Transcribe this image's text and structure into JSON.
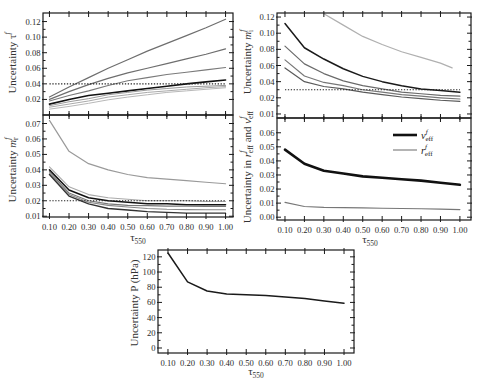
{
  "chart_data": [
    {
      "panel": "top-left",
      "type": "line",
      "title": "",
      "xlabel": "",
      "xlabel_parts": [],
      "ylabel": "Uncertainty τ^f",
      "ylabel_parts": [
        {
          "t": "Uncertainty τ"
        },
        {
          "sup": "f"
        }
      ],
      "xlim": [
        0.067,
        1.038
      ],
      "ylim": [
        0,
        0.131
      ],
      "grid": false,
      "x": [
        0.1,
        0.2,
        0.3,
        0.4,
        0.5,
        0.6,
        0.7,
        0.8,
        0.9,
        1.0
      ],
      "xticks": [
        0.1,
        0.2,
        0.3,
        0.4,
        0.5,
        0.6,
        0.7,
        0.8,
        0.9,
        1.0
      ],
      "xtick_labels": [],
      "yticks": [
        0.02,
        0.04,
        0.06,
        0.08,
        0.1,
        0.12
      ],
      "ytick_labels": [
        "0.02",
        "0.04",
        "0.06",
        "0.08",
        "0.10",
        "0.12"
      ],
      "series": [
        {
          "values": [
            0.023,
            0.036,
            0.048,
            0.06,
            0.071,
            0.082,
            0.092,
            0.102,
            0.112,
            0.123
          ],
          "color": "#6e6e6e",
          "width": 1.2,
          "style": "solid"
        },
        {
          "values": [
            0.02,
            0.03,
            0.039,
            0.047,
            0.054,
            0.06,
            0.066,
            0.072,
            0.078,
            0.085
          ],
          "color": "#6e6e6e",
          "width": 1.2,
          "style": "solid"
        },
        {
          "values": [
            0.018,
            0.025,
            0.031,
            0.038,
            0.044,
            0.048,
            0.052,
            0.055,
            0.058,
            0.061
          ],
          "color": "#7a7a7a",
          "width": 1.1,
          "style": "solid"
        },
        {
          "values": [
            0.014,
            0.02,
            0.025,
            0.028,
            0.031,
            0.034,
            0.037,
            0.04,
            0.0425,
            0.045
          ],
          "color": "#111111",
          "width": 1.6,
          "style": "solid"
        },
        {
          "values": [
            0.012,
            0.017,
            0.021,
            0.026,
            0.029,
            0.032,
            0.034,
            0.036,
            0.037,
            0.038
          ],
          "color": "#9a9a9a",
          "width": 1.0,
          "style": "solid"
        },
        {
          "values": [
            0.01,
            0.014,
            0.018,
            0.023,
            0.026,
            0.029,
            0.031,
            0.033,
            0.035,
            0.0365
          ],
          "color": "#aaaaaa",
          "width": 1.0,
          "style": "solid"
        },
        {
          "values": [
            0.0075,
            0.011,
            0.015,
            0.0195,
            0.023,
            0.026,
            0.029,
            0.031,
            0.033,
            0.035
          ],
          "color": "#b8b8b8",
          "width": 1.0,
          "style": "solid"
        },
        {
          "values": [
            0.04,
            0.04,
            0.04,
            0.04,
            0.04,
            0.04,
            0.04,
            0.04,
            0.04,
            0.04
          ],
          "color": "#222222",
          "width": 1.2,
          "style": "dotted"
        }
      ],
      "legend": null
    },
    {
      "panel": "top-right",
      "type": "line",
      "title": "",
      "xlabel": "",
      "xlabel_parts": [],
      "ylabel": "Uncertainty m_i^f",
      "ylabel_parts": [
        {
          "t": "Uncertainty "
        },
        {
          "t": "m",
          "i": true
        },
        {
          "sub": "i",
          "sup": "f"
        }
      ],
      "xlim": [
        0.059,
        1.057
      ],
      "ylim": [
        -0.005,
        0.125
      ],
      "grid": false,
      "x": [
        0.1,
        0.2,
        0.3,
        0.4,
        0.5,
        0.6,
        0.7,
        0.8,
        0.9,
        1.0
      ],
      "xticks": [
        0.1,
        0.2,
        0.3,
        0.4,
        0.5,
        0.6,
        0.7,
        0.8,
        0.9,
        1.0
      ],
      "xtick_labels": [],
      "yticks": [
        0.0,
        0.02,
        0.04,
        0.06,
        0.08,
        0.1,
        0.12
      ],
      "ytick_labels": [
        "0.01",
        "0.02",
        "0.04",
        "0.06",
        "0.08",
        "0.10",
        "0.12"
      ],
      "series": [
        {
          "x": [
            0.3,
            0.4,
            0.5,
            0.6,
            0.7,
            0.8,
            0.9,
            0.96
          ],
          "values": [
            0.124,
            0.11,
            0.096,
            0.086,
            0.077,
            0.07,
            0.063,
            0.057
          ],
          "color": "#b0b0b0",
          "width": 1.2,
          "style": "solid"
        },
        {
          "values": [
            0.112,
            0.082,
            0.068,
            0.056,
            0.0465,
            0.04,
            0.035,
            0.031,
            0.029,
            0.027
          ],
          "color": "#1a1a1a",
          "width": 1.5,
          "style": "solid"
        },
        {
          "values": [
            0.084,
            0.062,
            0.05,
            0.041,
            0.035,
            0.031,
            0.027,
            0.025,
            0.023,
            0.022
          ],
          "color": "#6a6a6a",
          "width": 1.2,
          "style": "solid"
        },
        {
          "values": [
            0.067,
            0.047,
            0.039,
            0.035,
            0.03,
            0.027,
            0.024,
            0.022,
            0.02,
            0.0185
          ],
          "color": "#777777",
          "width": 1.2,
          "style": "solid"
        },
        {
          "values": [
            0.057,
            0.04,
            0.034,
            0.031,
            0.027,
            0.024,
            0.021,
            0.019,
            0.017,
            0.0157
          ],
          "color": "#5a5a5a",
          "width": 1.2,
          "style": "solid"
        },
        {
          "values": [
            0.03,
            0.03,
            0.03,
            0.03,
            0.03,
            0.03,
            0.03,
            0.03,
            0.03,
            0.03
          ],
          "color": "#222222",
          "width": 1.2,
          "style": "dotted"
        }
      ],
      "legend": null
    },
    {
      "panel": "middle-left",
      "type": "line",
      "title": "",
      "xlabel": "τ550",
      "xlabel_parts": [
        {
          "t": "τ"
        },
        {
          "sub": "550"
        }
      ],
      "ylabel": "Uncertainty m_r^f",
      "ylabel_parts": [
        {
          "t": "Uncertainty "
        },
        {
          "t": "m",
          "i": true
        },
        {
          "sub": "r",
          "sup": "f"
        }
      ],
      "xlim": [
        0.067,
        1.038
      ],
      "ylim": [
        0.0095,
        0.0755
      ],
      "grid": false,
      "x": [
        0.1,
        0.2,
        0.3,
        0.4,
        0.5,
        0.6,
        0.7,
        0.8,
        0.9,
        1.0
      ],
      "xticks": [
        0.1,
        0.2,
        0.3,
        0.4,
        0.5,
        0.6,
        0.7,
        0.8,
        0.9,
        1.0
      ],
      "xtick_labels": [
        "0.10",
        "0.20",
        "0.30",
        "0.40",
        "0.50",
        "0.60",
        "0.70",
        "0.80",
        "0.90",
        "1.00"
      ],
      "yticks": [
        0.01,
        0.02,
        0.03,
        0.04,
        0.05,
        0.06,
        0.07
      ],
      "ytick_labels": [
        "0.01",
        "0.02",
        "0.03",
        "0.04",
        "0.05",
        "0.06",
        "0.07"
      ],
      "series": [
        {
          "values": [
            0.072,
            0.052,
            0.044,
            0.04,
            0.037,
            0.035,
            0.034,
            0.033,
            0.032,
            0.031
          ],
          "color": "#9a9a9a",
          "width": 1.2,
          "style": "solid"
        },
        {
          "values": [
            0.042,
            0.029,
            0.024,
            0.022,
            0.021,
            0.02,
            0.02,
            0.02,
            0.0195,
            0.0195
          ],
          "color": "#aaaaaa",
          "width": 1.1,
          "style": "solid"
        },
        {
          "values": [
            0.04,
            0.027,
            0.022,
            0.02,
            0.019,
            0.018,
            0.018,
            0.0175,
            0.0175,
            0.0175
          ],
          "color": "#111111",
          "width": 1.5,
          "style": "solid"
        },
        {
          "values": [
            0.039,
            0.025,
            0.02,
            0.018,
            0.017,
            0.0168,
            0.0166,
            0.0165,
            0.0164,
            0.0164
          ],
          "color": "#777777",
          "width": 1.2,
          "style": "solid"
        },
        {
          "values": [
            0.038,
            0.024,
            0.019,
            0.017,
            0.016,
            0.015,
            0.0145,
            0.0143,
            0.0142,
            0.0142
          ],
          "color": "#888888",
          "width": 1.1,
          "style": "solid"
        },
        {
          "values": [
            0.037,
            0.023,
            0.018,
            0.015,
            0.014,
            0.013,
            0.0125,
            0.012,
            0.012,
            0.012
          ],
          "color": "#333333",
          "width": 1.4,
          "style": "solid"
        },
        {
          "values": [
            0.02,
            0.02,
            0.02,
            0.02,
            0.02,
            0.02,
            0.02,
            0.02,
            0.02,
            0.02
          ],
          "color": "#222222",
          "width": 1.2,
          "style": "dotted"
        }
      ],
      "legend": null
    },
    {
      "panel": "middle-right",
      "type": "line",
      "title": "",
      "xlabel": "τ550",
      "xlabel_parts": [
        {
          "t": "τ"
        },
        {
          "sub": "550"
        }
      ],
      "ylabel": "Uncertainty in r_eff^f and v_eff^f",
      "ylabel_parts": [
        {
          "t": "Uncertainty in "
        },
        {
          "t": "r",
          "i": true
        },
        {
          "sub": "eff",
          "sup": "f"
        },
        {
          "t": " and "
        },
        {
          "t": "v",
          "i": true
        },
        {
          "sub": "eff",
          "sup": "f"
        }
      ],
      "xlim": [
        0.059,
        1.057
      ],
      "ylim": [
        -0.002,
        0.0705
      ],
      "grid": false,
      "x": [
        0.1,
        0.2,
        0.3,
        0.4,
        0.5,
        0.6,
        0.7,
        0.8,
        0.9,
        1.0
      ],
      "xticks": [
        0.1,
        0.2,
        0.3,
        0.4,
        0.5,
        0.6,
        0.7,
        0.8,
        0.9,
        1.0
      ],
      "xtick_labels": [
        "0.10",
        "0.20",
        "0.30",
        "0.40",
        "0.50",
        "0.60",
        "0.70",
        "0.80",
        "0.90",
        "1.00"
      ],
      "yticks": [
        0.0,
        0.01,
        0.02,
        0.03,
        0.04,
        0.05,
        0.06
      ],
      "ytick_labels": [
        "0.00",
        "0.01",
        "0.02",
        "0.03",
        "0.04",
        "0.05",
        "0.06"
      ],
      "series": [
        {
          "name": "v_eff^f",
          "label_parts": [
            {
              "t": "v",
              "i": true
            },
            {
              "sub": "eff",
              "sup": "f"
            }
          ],
          "values": [
            0.048,
            0.038,
            0.033,
            0.031,
            0.029,
            0.028,
            0.027,
            0.026,
            0.0245,
            0.023
          ],
          "color": "#111111",
          "width": 2.6,
          "style": "solid"
        },
        {
          "name": "r_eff^f",
          "label_parts": [
            {
              "t": "r",
              "i": true
            },
            {
              "sub": "eff",
              "sup": "f"
            }
          ],
          "values": [
            0.0105,
            0.0076,
            0.007,
            0.0068,
            0.0066,
            0.0064,
            0.0062,
            0.006,
            0.0057,
            0.0054
          ],
          "color": "#777777",
          "width": 1.1,
          "style": "solid"
        }
      ],
      "legend": {
        "position": "upper right",
        "entries": [
          0,
          1
        ]
      }
    },
    {
      "panel": "bottom",
      "type": "line",
      "title": "",
      "xlabel": "τ550",
      "xlabel_parts": [
        {
          "t": "τ"
        },
        {
          "sub": "550"
        }
      ],
      "ylabel": "Uncertainty P (hPa)",
      "ylabel_parts": [
        {
          "t": "Uncertainty P (hPa)"
        }
      ],
      "xlim": [
        0.049,
        1.051
      ],
      "ylim": [
        -6.6,
        129
      ],
      "grid": false,
      "x": [
        0.1,
        0.2,
        0.3,
        0.4,
        0.5,
        0.6,
        0.7,
        0.8,
        0.9,
        1.0
      ],
      "xticks": [
        0.1,
        0.2,
        0.3,
        0.4,
        0.5,
        0.6,
        0.7,
        0.8,
        0.9,
        1.0
      ],
      "xtick_labels": [
        "0.10",
        "0.20",
        "0.30",
        "0.40",
        "0.50",
        "0.60",
        "0.70",
        "0.80",
        "0.90",
        "1.00"
      ],
      "yticks": [
        0,
        20,
        40,
        60,
        80,
        100,
        120
      ],
      "ytick_labels": [
        "0",
        "20",
        "40",
        "60",
        "80",
        "100",
        "120"
      ],
      "series": [
        {
          "values": [
            125,
            87,
            75,
            71,
            70,
            69,
            67,
            65,
            62,
            59
          ],
          "color": "#1a1a1a",
          "width": 1.5,
          "style": "solid"
        }
      ],
      "legend": null
    }
  ]
}
